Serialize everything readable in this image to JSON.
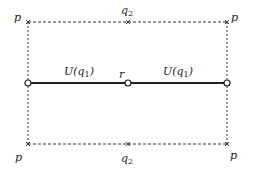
{
  "diagram": {
    "corner_labels": {
      "top_left": "p",
      "top_right": "p",
      "bottom_left": "p",
      "bottom_right": "p"
    },
    "top_mid": {
      "base": "q",
      "sub": "2"
    },
    "bottom_mid": {
      "base": "q",
      "sub": "2"
    },
    "segment_left": {
      "prefix": "U(q",
      "sub": "1",
      "suffix": ")"
    },
    "segment_right": {
      "prefix": "U(q",
      "sub": "1",
      "suffix": ")"
    },
    "center_point": "r",
    "colors": {
      "line": "#222222",
      "dashed": "#333333",
      "background": "#ffffff"
    }
  }
}
